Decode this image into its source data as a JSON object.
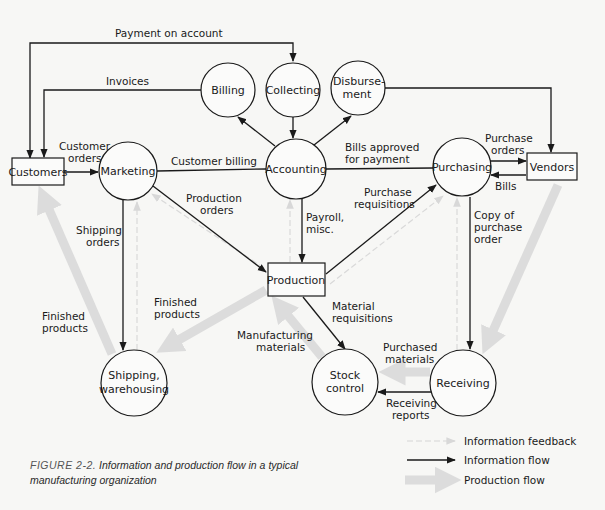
{
  "figure": {
    "number": "FIGURE 2-2.",
    "caption": "Information and production flow in a typical manufacturing organization",
    "caption_line1": "Information and production flow in a typical",
    "caption_line2": "manufacturing organization"
  },
  "colors": {
    "information_flow": "#1a1a1a",
    "information_feedback": "#d6d6d6",
    "production_flow": "#dcdcdc",
    "background": "#f7f7f5"
  },
  "nodes": {
    "customers": "Customers",
    "marketing": "Marketing",
    "billing": "Billing",
    "collecting": "Collecting",
    "disbursement_1": "Disburse-",
    "disbursement_2": "ment",
    "accounting": "Accounting",
    "purchasing": "Purchasing",
    "vendors": "Vendors",
    "production": "Production",
    "shipping_1": "Shipping,",
    "shipping_2": "warehousing",
    "stock_1": "Stock",
    "stock_2": "control",
    "receiving": "Receiving"
  },
  "edges": {
    "payment_on_account": "Payment on account",
    "invoices": "Invoices",
    "customer_orders_1": "Customer",
    "customer_orders_2": "orders",
    "customer_billing": "Customer billing",
    "bills_approved_1": "Bills approved",
    "bills_approved_2": "for payment",
    "purchase_orders_1": "Purchase",
    "purchase_orders_2": "orders",
    "bills": "Bills",
    "production_orders_1": "Production",
    "production_orders_2": "orders",
    "payroll_1": "Payroll,",
    "payroll_2": "misc.",
    "purchase_req_1": "Purchase",
    "purchase_req_2": "requisitions",
    "copy_po_1": "Copy of",
    "copy_po_2": "purchase",
    "copy_po_3": "order",
    "shipping_orders_1": "Shipping",
    "shipping_orders_2": "orders",
    "finished_left_1": "Finished",
    "finished_left_2": "products",
    "finished_mid_1": "Finished",
    "finished_mid_2": "products",
    "manufacturing_1": "Manufacturing",
    "manufacturing_2": "materials",
    "material_req_1": "Material",
    "material_req_2": "requisitions",
    "purchased_1": "Purchased",
    "purchased_2": "materials",
    "receiving_reports_1": "Receiving",
    "receiving_reports_2": "reports"
  },
  "legend": {
    "items": [
      {
        "label": "Information feedback",
        "style": "faint-dashed"
      },
      {
        "label": "Information flow",
        "style": "solid-arrow"
      },
      {
        "label": "Production flow",
        "style": "thick-gray-arrow"
      }
    ]
  }
}
